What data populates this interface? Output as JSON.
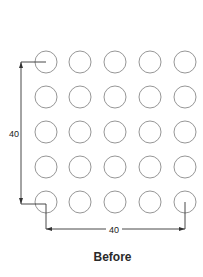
{
  "diagram": {
    "title": "Before",
    "grid": {
      "rows": 5,
      "cols": 5,
      "col_x": [
        46,
        80,
        115,
        150,
        185
      ],
      "row_y": [
        62,
        97,
        132,
        167,
        202
      ],
      "radius": 11,
      "stroke_color": "#8a8a8a"
    },
    "dimensions": {
      "vertical": {
        "label": "40",
        "line_x": 21,
        "from_y": 62,
        "to_y": 204,
        "label_x": 16,
        "label_y": 136
      },
      "horizontal": {
        "label": "40",
        "line_y": 229,
        "from_x": 46,
        "to_x": 185,
        "label_x": 114,
        "label_y": 233
      },
      "line_color": "#333333"
    }
  }
}
